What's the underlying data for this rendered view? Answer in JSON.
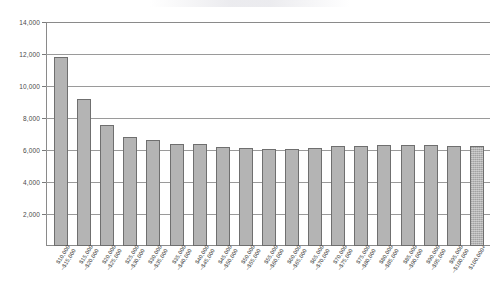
{
  "chart_data": {
    "type": "bar",
    "title": "",
    "subtitle": "",
    "xlabel": "",
    "ylabel": "",
    "ylim": [
      0,
      14000
    ],
    "grid": true,
    "legend": false,
    "orientation": "vertical",
    "y_ticks": [
      "2,000",
      "4,000",
      "6,000",
      "8,000",
      "10,000",
      "12,000",
      "14,000"
    ],
    "y_tick_values": [
      2000,
      4000,
      6000,
      8000,
      10000,
      12000,
      14000
    ],
    "categories": [
      "$10,000–$15,000",
      "$15,000–$20,000",
      "$20,000–$25,000",
      "$25,000–$30,000",
      "$30,000–$35,000",
      "$35,000–$40,000",
      "$40,000–$45,000",
      "$45,000–$50,000",
      "$50,000–$55,000",
      "$55,000–$60,000",
      "$60,000–$65,000",
      "$65,000–$70,000",
      "$70,000–$75,000",
      "$75,000–$80,000",
      "$80,000–$85,000",
      "$85,000–$90,000",
      "$90,000–$95,000",
      "$95,000–$100,000",
      "$100,000+"
    ],
    "category_lines": [
      [
        "$10,000",
        "–$15,000"
      ],
      [
        "$15,000",
        "–$20,000"
      ],
      [
        "$20,000",
        "–$25,000"
      ],
      [
        "$25,000",
        "–$30,000"
      ],
      [
        "$30,000",
        "–$35,000"
      ],
      [
        "$35,000",
        "–$40,000"
      ],
      [
        "$40,000",
        "–$45,000"
      ],
      [
        "$45,000",
        "–$50,000"
      ],
      [
        "$50,000",
        "–$55,000"
      ],
      [
        "$55,000",
        "–$60,000"
      ],
      [
        "$60,000",
        "–$65,000"
      ],
      [
        "$65,000",
        "–$70,000"
      ],
      [
        "$70,000",
        "–$75,000"
      ],
      [
        "$75,000",
        "–$80,000"
      ],
      [
        "$80,000",
        "–$85,000"
      ],
      [
        "$85,000",
        "–$90,000"
      ],
      [
        "$90,000",
        "–$95,000"
      ],
      [
        "$95,000",
        "–$100,000"
      ],
      [
        "$100,000+",
        ""
      ]
    ],
    "values": [
      11800,
      9200,
      7550,
      6800,
      6600,
      6400,
      6400,
      6200,
      6100,
      6050,
      6050,
      6150,
      6250,
      6250,
      6300,
      6300,
      6300,
      6250,
      6250
    ],
    "bar_styles": [
      "solid",
      "solid",
      "solid",
      "solid",
      "solid",
      "solid",
      "solid",
      "solid",
      "solid",
      "solid",
      "solid",
      "solid",
      "solid",
      "solid",
      "solid",
      "solid",
      "solid",
      "solid",
      "textured"
    ],
    "colors": {
      "bar_fill": "#b4b4b4",
      "bar_stroke": "#6f6f6f",
      "gridline": "#9a9a9a",
      "axis": "#8a8a8a",
      "label_text": "#3d3d3d"
    }
  }
}
